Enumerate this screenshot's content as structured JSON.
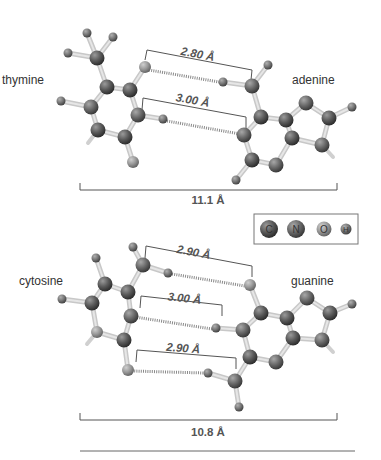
{
  "colors": {
    "carbon": "#5a5a5a",
    "nitrogen": "#6e6e6e",
    "oxygen": "#9a9a9a",
    "hydrogen": "#7a7a7a",
    "bond": "#d2d2d2",
    "bracket": "#555555",
    "hbond": "#888888"
  },
  "legend": {
    "items": [
      {
        "symbol": "C",
        "name": "carbon"
      },
      {
        "symbol": "N",
        "name": "nitrogen"
      },
      {
        "symbol": "O",
        "name": "oxygen"
      },
      {
        "symbol": "H",
        "name": "hydrogen"
      }
    ]
  },
  "pairs": [
    {
      "name": "thymine-adenine",
      "left_label": "thymine",
      "right_label": "adenine",
      "total_distance": "11.1 Å",
      "hbonds": [
        {
          "label": "2.80 Å"
        },
        {
          "label": "3.00 Å"
        }
      ]
    },
    {
      "name": "cytosine-guanine",
      "left_label": "cytosine",
      "right_label": "guanine",
      "total_distance": "10.8 Å",
      "hbonds": [
        {
          "label": "2.90 Å"
        },
        {
          "label": "3.00 Å"
        },
        {
          "label": "2.90 Å"
        }
      ]
    }
  ],
  "molecules": {
    "thymine": {
      "atoms": [
        [
          97,
          58,
          "C"
        ],
        [
          87,
          33,
          "H"
        ],
        [
          113,
          37,
          "H"
        ],
        [
          68,
          53,
          "H"
        ],
        [
          107,
          87,
          "C"
        ],
        [
          130,
          90,
          "C"
        ],
        [
          138,
          115,
          "N"
        ],
        [
          125,
          137,
          "C"
        ],
        [
          98,
          130,
          "C"
        ],
        [
          91,
          107,
          "N"
        ],
        [
          145,
          67,
          "O"
        ],
        [
          163,
          119,
          "H"
        ],
        [
          61,
          101,
          "H"
        ],
        [
          133,
          162,
          "O"
        ]
      ],
      "bonds": [
        [
          0,
          1
        ],
        [
          0,
          2
        ],
        [
          0,
          3
        ],
        [
          0,
          4
        ],
        [
          4,
          5
        ],
        [
          5,
          6
        ],
        [
          6,
          7
        ],
        [
          7,
          8
        ],
        [
          8,
          9
        ],
        [
          9,
          4
        ],
        [
          5,
          10
        ],
        [
          6,
          11
        ],
        [
          9,
          12
        ],
        [
          7,
          13
        ]
      ],
      "stubs": [
        [
          98,
          130,
          88,
          143
        ]
      ]
    },
    "adenine": {
      "atoms": [
        [
          252,
          86,
          "N"
        ],
        [
          268,
          65,
          "H"
        ],
        [
          223,
          82,
          "H"
        ],
        [
          261,
          117,
          "C"
        ],
        [
          244,
          135,
          "N"
        ],
        [
          252,
          160,
          "C"
        ],
        [
          276,
          165,
          "N"
        ],
        [
          292,
          138,
          "C"
        ],
        [
          286,
          120,
          "C"
        ],
        [
          306,
          103,
          "N"
        ],
        [
          329,
          118,
          "C"
        ],
        [
          322,
          145,
          "N"
        ],
        [
          352,
          107,
          "H"
        ],
        [
          236,
          180,
          "H"
        ]
      ],
      "bonds": [
        [
          0,
          1
        ],
        [
          0,
          2
        ],
        [
          0,
          3
        ],
        [
          3,
          4
        ],
        [
          4,
          5
        ],
        [
          5,
          6
        ],
        [
          6,
          7
        ],
        [
          7,
          8
        ],
        [
          8,
          3
        ],
        [
          8,
          9
        ],
        [
          9,
          10
        ],
        [
          10,
          11
        ],
        [
          11,
          7
        ],
        [
          10,
          12
        ],
        [
          5,
          13
        ]
      ],
      "stubs": [
        [
          322,
          145,
          333,
          157
        ]
      ]
    },
    "cytosine": {
      "atoms": [
        [
          143,
          265,
          "N"
        ],
        [
          133,
          247,
          "H"
        ],
        [
          168,
          273,
          "H"
        ],
        [
          128,
          292,
          "C"
        ],
        [
          131,
          316,
          "N"
        ],
        [
          124,
          340,
          "C"
        ],
        [
          97,
          332,
          "O"
        ],
        [
          92,
          303,
          "C"
        ],
        [
          105,
          284,
          "C"
        ],
        [
          96,
          258,
          "H"
        ],
        [
          62,
          299,
          "H"
        ],
        [
          128,
          370,
          "O"
        ]
      ],
      "bonds": [
        [
          0,
          1
        ],
        [
          0,
          2
        ],
        [
          0,
          3
        ],
        [
          3,
          4
        ],
        [
          4,
          5
        ],
        [
          5,
          6
        ],
        [
          6,
          7
        ],
        [
          7,
          8
        ],
        [
          8,
          3
        ],
        [
          8,
          9
        ],
        [
          7,
          10
        ],
        [
          5,
          11
        ]
      ],
      "stubs": [
        [
          97,
          332,
          87,
          344
        ]
      ]
    },
    "guanine": {
      "atoms": [
        [
          250,
          285,
          "O"
        ],
        [
          261,
          313,
          "C"
        ],
        [
          243,
          330,
          "N"
        ],
        [
          250,
          357,
          "C"
        ],
        [
          276,
          362,
          "N"
        ],
        [
          293,
          338,
          "C"
        ],
        [
          287,
          318,
          "C"
        ],
        [
          307,
          298,
          "N"
        ],
        [
          330,
          313,
          "C"
        ],
        [
          322,
          340,
          "N"
        ],
        [
          352,
          304,
          "H"
        ],
        [
          216,
          328,
          "H"
        ],
        [
          235,
          381,
          "N"
        ],
        [
          208,
          373,
          "H"
        ],
        [
          239,
          407,
          "H"
        ]
      ],
      "bonds": [
        [
          0,
          1
        ],
        [
          1,
          2
        ],
        [
          2,
          3
        ],
        [
          3,
          4
        ],
        [
          4,
          5
        ],
        [
          5,
          6
        ],
        [
          6,
          1
        ],
        [
          6,
          7
        ],
        [
          7,
          8
        ],
        [
          8,
          9
        ],
        [
          9,
          5
        ],
        [
          8,
          10
        ],
        [
          2,
          11
        ],
        [
          3,
          12
        ],
        [
          12,
          13
        ],
        [
          12,
          14
        ]
      ],
      "stubs": [
        [
          322,
          340,
          333,
          352
        ]
      ]
    }
  },
  "hbond_lines": [
    {
      "x1": 149,
      "y1": 70,
      "x2": 219,
      "y2": 82,
      "bracket": [
        145,
        60,
        147,
        50,
        252,
        70,
        251,
        80
      ],
      "text_x": 197,
      "text_y": 58,
      "label_ref": "pairs.0.hbonds.0.label"
    },
    {
      "x1": 167,
      "y1": 121,
      "x2": 240,
      "y2": 134,
      "bracket": [
        142,
        110,
        143,
        98,
        246,
        117,
        246,
        128
      ],
      "text_x": 192,
      "text_y": 104,
      "label_ref": "pairs.0.hbonds.1.label"
    },
    {
      "x1": 172,
      "y1": 274,
      "x2": 245,
      "y2": 286,
      "bracket": [
        145,
        258,
        146,
        246,
        252,
        266,
        252,
        277
      ],
      "text_x": 193,
      "text_y": 256,
      "label_ref": "pairs.1.hbonds.0.label"
    },
    {
      "x1": 135,
      "y1": 317,
      "x2": 212,
      "y2": 329,
      "bracket": [
        140,
        308,
        141,
        296,
        222,
        305,
        222,
        316
      ],
      "text_x": 184,
      "text_y": 302,
      "label_ref": "pairs.1.hbonds.1.label"
    },
    {
      "x1": 132,
      "y1": 371,
      "x2": 204,
      "y2": 373,
      "bracket": [
        136,
        362,
        137,
        350,
        236,
        358,
        236,
        369
      ],
      "text_x": 183,
      "text_y": 352,
      "label_ref": "pairs.1.hbonds.2.label"
    }
  ]
}
